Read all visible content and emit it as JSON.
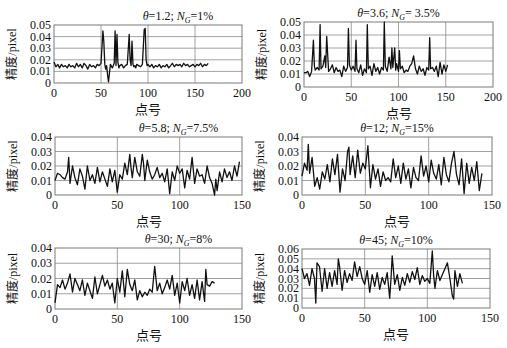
{
  "figure": {
    "width": 507,
    "height": 348,
    "line_color": "#111111",
    "grid_color": "#8a8a8a",
    "frame_color": "#7a7a7a"
  },
  "chart_data": [
    {
      "type": "line",
      "title_theta": "1.2",
      "title_ng": "1%",
      "title": "θ=1.2; N_G=1%",
      "xlabel": "点号",
      "ylabel": "精度/pixel",
      "xlim": [
        0,
        200
      ],
      "ylim": [
        0,
        0.05
      ],
      "xticks": [
        0,
        50,
        100,
        150,
        200
      ],
      "yticks": [
        0,
        0.01,
        0.02,
        0.03,
        0.04,
        0.05
      ],
      "ytick_labels": [
        "0",
        "0.01",
        "0.02",
        "0.03",
        "0.04",
        "0.05"
      ],
      "grid": true,
      "box": {
        "x0": 54,
        "y0": 25,
        "x1": 242,
        "y1": 83
      },
      "x": [
        0,
        2,
        4,
        6,
        8,
        10,
        12,
        14,
        16,
        18,
        20,
        22,
        24,
        26,
        28,
        30,
        32,
        34,
        36,
        38,
        40,
        42,
        44,
        46,
        48,
        50,
        51,
        52,
        53,
        54,
        55,
        56,
        57,
        58,
        59,
        60,
        62,
        64,
        65,
        66,
        67,
        68,
        69,
        70,
        72,
        74,
        76,
        78,
        80,
        81,
        82,
        83,
        84,
        85,
        86,
        87,
        88,
        90,
        92,
        94,
        96,
        97,
        98,
        99,
        100,
        102,
        104,
        106,
        108,
        110,
        112,
        114,
        116,
        118,
        120,
        122,
        124,
        126,
        128,
        130,
        132,
        134,
        136,
        138,
        140,
        142,
        144,
        146,
        148,
        150,
        152,
        154,
        156,
        158,
        160,
        162,
        164
      ],
      "values": [
        0.018,
        0.014,
        0.016,
        0.013,
        0.016,
        0.014,
        0.015,
        0.013,
        0.016,
        0.014,
        0.015,
        0.013,
        0.017,
        0.014,
        0.016,
        0.013,
        0.017,
        0.015,
        0.012,
        0.016,
        0.014,
        0.015,
        0.013,
        0.016,
        0.015,
        0.017,
        0.03,
        0.045,
        0.036,
        0.016,
        0.012,
        0.015,
        0.007,
        0.001,
        0.009,
        0.016,
        0.013,
        0.017,
        0.045,
        0.015,
        0.042,
        0.018,
        0.013,
        0.015,
        0.016,
        0.013,
        0.015,
        0.016,
        0.042,
        0.02,
        0.015,
        0.036,
        0.016,
        0.014,
        0.015,
        0.013,
        0.016,
        0.015,
        0.014,
        0.016,
        0.046,
        0.047,
        0.02,
        0.015,
        0.016,
        0.014,
        0.016,
        0.013,
        0.015,
        0.014,
        0.016,
        0.013,
        0.015,
        0.014,
        0.016,
        0.013,
        0.015,
        0.017,
        0.014,
        0.016,
        0.015,
        0.016,
        0.014,
        0.017,
        0.015,
        0.016,
        0.014,
        0.015,
        0.016,
        0.014,
        0.016,
        0.015,
        0.017,
        0.014,
        0.016,
        0.015,
        0.017
      ]
    },
    {
      "type": "line",
      "title_theta": "3.6",
      "title_ng": " 3.5%",
      "title": "θ=3.6; N_G= 3.5%",
      "xlabel": "点号",
      "ylabel": "精度/pixel",
      "xlim": [
        0,
        200
      ],
      "ylim": [
        0,
        0.05
      ],
      "xticks": [
        0,
        50,
        100,
        150,
        200
      ],
      "yticks": [
        0,
        0.01,
        0.02,
        0.03,
        0.04,
        0.05
      ],
      "ytick_labels": [
        "0",
        "0.01",
        "0.02",
        "0.03",
        "0.04",
        "0.05"
      ],
      "grid": true,
      "box": {
        "x0": 304,
        "y0": 22,
        "x1": 493,
        "y1": 87
      },
      "x": [
        0,
        2,
        4,
        6,
        8,
        10,
        11,
        12,
        14,
        16,
        17,
        18,
        20,
        22,
        23,
        24,
        26,
        28,
        30,
        32,
        34,
        36,
        38,
        40,
        42,
        44,
        46,
        47,
        48,
        50,
        52,
        54,
        55,
        56,
        58,
        60,
        62,
        64,
        66,
        67,
        68,
        70,
        72,
        74,
        76,
        78,
        80,
        82,
        84,
        85,
        86,
        88,
        90,
        92,
        93,
        94,
        96,
        97,
        98,
        100,
        101,
        102,
        104,
        106,
        108,
        110,
        112,
        114,
        116,
        118,
        120,
        122,
        124,
        126,
        128,
        130,
        132,
        133,
        134,
        136,
        138,
        140,
        142,
        144,
        146,
        148,
        150,
        152
      ],
      "values": [
        0.011,
        0.011,
        0.012,
        0.008,
        0.012,
        0.036,
        0.016,
        0.013,
        0.015,
        0.013,
        0.048,
        0.014,
        0.016,
        0.024,
        0.015,
        0.039,
        0.012,
        0.014,
        0.017,
        0.011,
        0.015,
        0.012,
        0.013,
        0.008,
        0.016,
        0.012,
        0.015,
        0.045,
        0.017,
        0.013,
        0.016,
        0.012,
        0.036,
        0.014,
        0.011,
        0.017,
        0.009,
        0.014,
        0.011,
        0.048,
        0.014,
        0.016,
        0.009,
        0.018,
        0.012,
        0.015,
        0.01,
        0.015,
        0.013,
        0.05,
        0.016,
        0.012,
        0.023,
        0.014,
        0.03,
        0.015,
        0.03,
        0.013,
        0.018,
        0.012,
        0.028,
        0.014,
        0.016,
        0.011,
        0.013,
        0.012,
        0.016,
        0.018,
        0.024,
        0.014,
        0.01,
        0.016,
        0.012,
        0.014,
        0.009,
        0.015,
        0.013,
        0.038,
        0.014,
        0.015,
        0.012,
        0.016,
        0.008,
        0.019,
        0.01,
        0.017,
        0.012,
        0.017
      ]
    },
    {
      "type": "line",
      "title_theta": "5.8",
      "title_ng": "7.5%",
      "title": "θ=5.8; N_G=7.5%",
      "xlabel": "点号",
      "ylabel": "精度/pixel",
      "xlim": [
        0,
        150
      ],
      "ylim": [
        0,
        0.04
      ],
      "xticks": [
        0,
        50,
        100,
        150
      ],
      "yticks": [
        0,
        0.01,
        0.02,
        0.03,
        0.04
      ],
      "ytick_labels": [
        "0",
        "0.01",
        "0.02",
        "0.03",
        "0.04"
      ],
      "grid": true,
      "box": {
        "x0": 55,
        "y0": 137,
        "x1": 242,
        "y1": 195
      },
      "x": [
        0,
        2,
        4,
        6,
        8,
        10,
        11,
        12,
        14,
        16,
        18,
        20,
        22,
        24,
        26,
        28,
        30,
        32,
        34,
        36,
        38,
        40,
        42,
        44,
        46,
        48,
        50,
        52,
        54,
        56,
        58,
        60,
        61,
        62,
        64,
        66,
        68,
        70,
        71,
        72,
        74,
        76,
        78,
        80,
        82,
        84,
        86,
        88,
        90,
        92,
        94,
        96,
        98,
        100,
        102,
        104,
        106,
        108,
        110,
        112,
        114,
        116,
        118,
        120,
        122,
        124,
        126,
        128,
        129,
        130,
        132,
        134,
        136,
        138,
        140,
        142,
        144,
        146,
        148
      ],
      "values": [
        0.01,
        0.015,
        0.014,
        0.012,
        0.011,
        0.016,
        0.026,
        0.008,
        0.02,
        0.012,
        0.007,
        0.018,
        0.013,
        0.004,
        0.02,
        0.01,
        0.014,
        0.008,
        0.019,
        0.009,
        0.016,
        0.011,
        0.006,
        0.018,
        0.009,
        0.017,
        0.002,
        0.014,
        0.011,
        0.022,
        0.014,
        0.028,
        0.019,
        0.012,
        0.026,
        0.016,
        0.013,
        0.028,
        0.022,
        0.01,
        0.024,
        0.016,
        0.011,
        0.014,
        0.019,
        0.012,
        0.015,
        0.009,
        0.018,
        0.001,
        0.016,
        0.01,
        0.02,
        0.015,
        0.018,
        0.005,
        0.017,
        0.011,
        0.026,
        0.008,
        0.018,
        0.013,
        0.014,
        0.008,
        0.02,
        0.012,
        0.008,
        0.0,
        0.011,
        0.003,
        0.016,
        0.009,
        0.018,
        0.012,
        0.016,
        0.01,
        0.02,
        0.013,
        0.023
      ]
    },
    {
      "type": "line",
      "title_theta": "12",
      "title_ng": "15%",
      "title": "θ=12; N_G=15%",
      "xlabel": "点号",
      "ylabel": "精度/pixel",
      "xlim": [
        0,
        150
      ],
      "ylim": [
        0,
        0.04
      ],
      "xticks": [
        0,
        50,
        100,
        150
      ],
      "yticks": [
        0,
        0.01,
        0.02,
        0.03,
        0.04
      ],
      "ytick_labels": [
        "0",
        "0.01",
        "0.02",
        "0.03",
        "0.04"
      ],
      "grid": true,
      "box": {
        "x0": 302,
        "y0": 137,
        "x1": 492,
        "y1": 195
      },
      "x": [
        0,
        2,
        4,
        5,
        6,
        8,
        10,
        12,
        14,
        16,
        18,
        20,
        22,
        24,
        26,
        28,
        30,
        32,
        34,
        36,
        37,
        38,
        40,
        42,
        44,
        46,
        48,
        50,
        52,
        54,
        56,
        58,
        60,
        62,
        64,
        66,
        68,
        70,
        72,
        74,
        76,
        78,
        80,
        82,
        84,
        86,
        88,
        90,
        92,
        94,
        96,
        98,
        100,
        102,
        104,
        106,
        108,
        110,
        112,
        114,
        116,
        118,
        120,
        122,
        124,
        126,
        128,
        130,
        132,
        134,
        136,
        138,
        140,
        142
      ],
      "values": [
        0.013,
        0.022,
        0.017,
        0.035,
        0.015,
        0.026,
        0.006,
        0.012,
        0.004,
        0.016,
        0.011,
        0.021,
        0.009,
        0.025,
        0.014,
        0.028,
        0.002,
        0.018,
        0.01,
        0.03,
        0.033,
        0.014,
        0.027,
        0.012,
        0.031,
        0.015,
        0.022,
        0.018,
        0.034,
        0.005,
        0.021,
        0.011,
        0.018,
        0.006,
        0.016,
        0.01,
        0.012,
        0.009,
        0.025,
        0.012,
        0.02,
        0.008,
        0.022,
        0.011,
        0.018,
        0.005,
        0.019,
        0.012,
        0.01,
        0.027,
        0.013,
        0.02,
        0.009,
        0.024,
        0.015,
        0.011,
        0.021,
        0.007,
        0.026,
        0.014,
        0.009,
        0.022,
        0.03,
        0.014,
        0.007,
        0.025,
        0.001,
        0.022,
        0.008,
        0.019,
        0.01,
        0.023,
        0.003,
        0.015
      ]
    },
    {
      "type": "line",
      "title_theta": "30",
      "title_ng": "8%",
      "title": "θ=30; N_G=8%",
      "xlabel": "点号",
      "ylabel": "精度/pixel",
      "xlim": [
        0,
        150
      ],
      "ylim": [
        0,
        0.04
      ],
      "xticks": [
        0,
        50,
        100,
        150
      ],
      "yticks": [
        0,
        0.01,
        0.02,
        0.03,
        0.04
      ],
      "ytick_labels": [
        "0",
        "0.01",
        "0.02",
        "0.03",
        "0.04"
      ],
      "grid": true,
      "box": {
        "x0": 55,
        "y0": 248,
        "x1": 242,
        "y1": 309
      },
      "x": [
        0,
        2,
        4,
        6,
        8,
        10,
        12,
        14,
        16,
        18,
        20,
        22,
        24,
        26,
        28,
        30,
        32,
        34,
        36,
        38,
        40,
        42,
        44,
        46,
        48,
        50,
        52,
        54,
        56,
        58,
        60,
        62,
        64,
        66,
        68,
        70,
        72,
        74,
        76,
        78,
        80,
        82,
        84,
        86,
        88,
        90,
        92,
        94,
        96,
        98,
        100,
        102,
        104,
        106,
        108,
        110,
        112,
        114,
        116,
        118,
        120,
        121,
        122,
        124,
        126,
        128
      ],
      "values": [
        0.004,
        0.016,
        0.014,
        0.019,
        0.013,
        0.017,
        0.023,
        0.011,
        0.02,
        0.016,
        0.012,
        0.019,
        0.009,
        0.017,
        0.012,
        0.007,
        0.021,
        0.01,
        0.016,
        0.022,
        0.015,
        0.019,
        0.013,
        0.017,
        0.004,
        0.02,
        0.011,
        0.025,
        0.008,
        0.026,
        0.016,
        0.012,
        0.019,
        0.006,
        0.012,
        0.008,
        0.011,
        0.009,
        0.013,
        0.011,
        0.028,
        0.012,
        0.017,
        0.01,
        0.014,
        0.019,
        0.013,
        0.022,
        0.009,
        0.017,
        0.004,
        0.018,
        0.012,
        0.02,
        0.009,
        0.016,
        0.007,
        0.019,
        0.006,
        0.018,
        0.005,
        0.026,
        0.016,
        0.015,
        0.018,
        0.017
      ]
    },
    {
      "type": "line",
      "title_theta": "45",
      "title_ng": "10%",
      "title": "θ=45; N_G=10%",
      "xlabel": "点号",
      "ylabel": "精度/pixel",
      "xlim": [
        0,
        150
      ],
      "ylim": [
        0,
        0.06
      ],
      "xticks": [
        0,
        50,
        100,
        150
      ],
      "yticks": [
        0,
        0.01,
        0.02,
        0.03,
        0.04,
        0.05,
        0.06
      ],
      "ytick_labels": [
        "0",
        "0.01",
        "0.02",
        "0.03",
        "0.04",
        "0.05",
        "0.06"
      ],
      "grid": true,
      "box": {
        "x0": 302,
        "y0": 249,
        "x1": 490,
        "y1": 308
      },
      "x": [
        0,
        2,
        4,
        6,
        8,
        10,
        11,
        12,
        14,
        16,
        18,
        20,
        22,
        24,
        26,
        28,
        29,
        30,
        32,
        34,
        36,
        38,
        40,
        42,
        44,
        46,
        48,
        50,
        52,
        54,
        56,
        58,
        60,
        62,
        64,
        66,
        68,
        70,
        71,
        72,
        74,
        76,
        78,
        80,
        82,
        84,
        86,
        88,
        90,
        92,
        94,
        96,
        98,
        100,
        102,
        104,
        105,
        106,
        108,
        110,
        112,
        114,
        116,
        118,
        120,
        121,
        122,
        124,
        126,
        128
      ],
      "values": [
        0.04,
        0.03,
        0.035,
        0.023,
        0.04,
        0.03,
        0.005,
        0.046,
        0.042,
        0.017,
        0.04,
        0.02,
        0.036,
        0.022,
        0.038,
        0.024,
        0.05,
        0.042,
        0.018,
        0.038,
        0.026,
        0.035,
        0.028,
        0.047,
        0.032,
        0.042,
        0.03,
        0.024,
        0.038,
        0.016,
        0.034,
        0.022,
        0.036,
        0.019,
        0.031,
        0.024,
        0.036,
        0.01,
        0.03,
        0.053,
        0.024,
        0.034,
        0.018,
        0.031,
        0.023,
        0.035,
        0.026,
        0.037,
        0.029,
        0.041,
        0.024,
        0.033,
        0.027,
        0.03,
        0.025,
        0.058,
        0.034,
        0.02,
        0.038,
        0.028,
        0.034,
        0.04,
        0.046,
        0.03,
        0.012,
        0.009,
        0.038,
        0.022,
        0.035,
        0.025
      ]
    }
  ]
}
